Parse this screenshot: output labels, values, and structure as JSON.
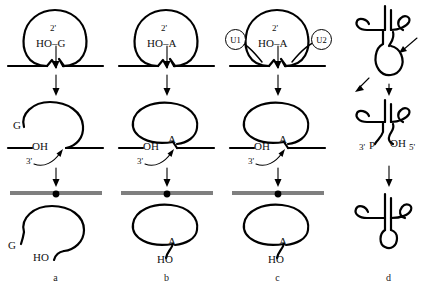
{
  "figure": {
    "caption_labels": [
      "a",
      "b",
      "c",
      "d"
    ],
    "width": 445,
    "height": 289,
    "stroke_color": "#000000",
    "exon_color": "#555555"
  },
  "panels": [
    {
      "id": "a",
      "name": "group-i-intron-self-splicing",
      "label": "a",
      "stage1": {
        "prime_label": "2'",
        "nucleophile_label": "HO–G",
        "loop": "intron-lariat-loop"
      },
      "stage2": {
        "nucleotide_label": "G",
        "hydroxyl_label": "OH",
        "prime_label": "3'"
      },
      "stage3": {
        "nucleotide_label": "G",
        "hydroxyl_label": "HO"
      }
    },
    {
      "id": "b",
      "name": "group-ii-intron-self-splicing",
      "label": "b",
      "stage1": {
        "prime_label": "2'",
        "nucleophile_label": "HO–A",
        "loop": "intron-lariat-loop"
      },
      "stage2": {
        "nucleotide_label": "A",
        "hydroxyl_label": "OH",
        "prime_label": "3'"
      },
      "stage3": {
        "nucleotide_label": "A",
        "hydroxyl_label": "HO"
      }
    },
    {
      "id": "c",
      "name": "spliceosomal-pre-mrna-splicing",
      "label": "c",
      "stage1": {
        "prime_label": "2'",
        "nucleophile_label": "HO–A",
        "snrnp_left": "U1",
        "snrnp_right": "U2",
        "loop": "intron-lariat-loop"
      },
      "stage2": {
        "nucleotide_label": "A",
        "hydroxyl_label": "OH",
        "prime_label": "3'"
      },
      "stage3": {
        "nucleotide_label": "A",
        "hydroxyl_label": "HO"
      }
    },
    {
      "id": "d",
      "name": "trna-intron-endonuclease-splicing",
      "label": "d",
      "stage1": {
        "structure": "trna-cloverleaf-with-intron"
      },
      "stage2": {
        "left_label": "3'",
        "left_group": "P",
        "right_group": "OH",
        "right_label": "5'"
      },
      "stage3": {
        "structure": "mature-trna-cloverleaf"
      }
    }
  ]
}
